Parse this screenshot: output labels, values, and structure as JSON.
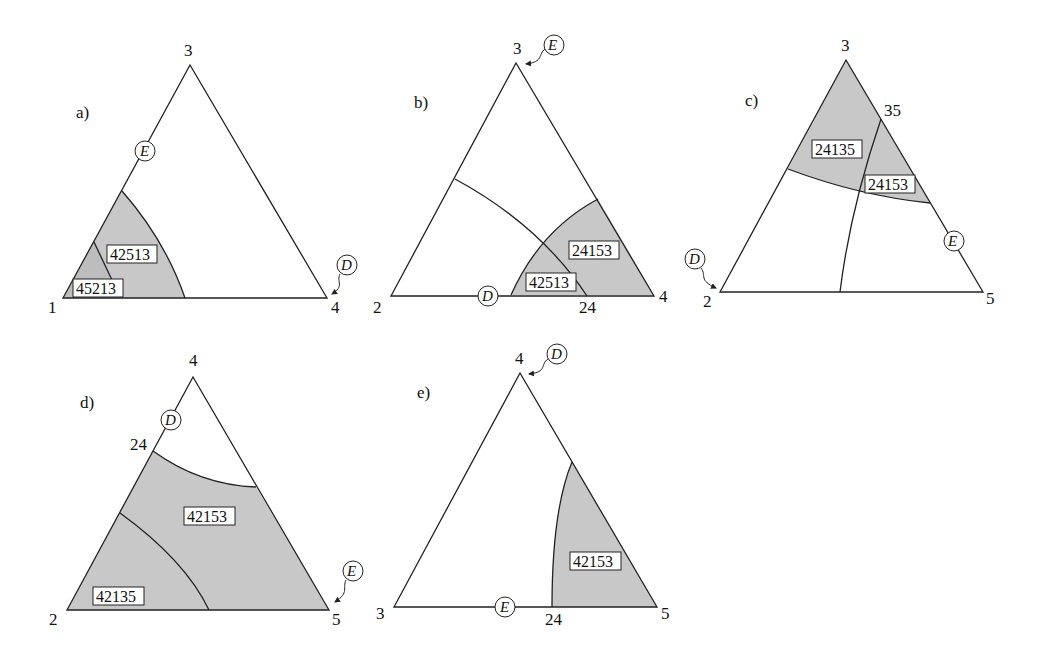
{
  "panels": {
    "a": {
      "label": "a)",
      "vertices": {
        "top": "3",
        "left": "1",
        "right": "4"
      },
      "regions": [
        "42513",
        "45213"
      ],
      "markers": {
        "E": "E",
        "D": "D"
      }
    },
    "b": {
      "label": "b)",
      "vertices": {
        "top": "3",
        "left": "2",
        "right": "4"
      },
      "edge_point": "24",
      "regions": [
        "24153",
        "42513"
      ],
      "markers": {
        "E": "E",
        "D": "D"
      }
    },
    "c": {
      "label": "c)",
      "vertices": {
        "top": "3",
        "left": "2",
        "right": "5"
      },
      "edge_point": "35",
      "regions": [
        "24135",
        "24153"
      ],
      "markers": {
        "E": "E",
        "D": "D"
      }
    },
    "d": {
      "label": "d)",
      "vertices": {
        "top": "4",
        "left": "2",
        "right": "5"
      },
      "edge_point": "24",
      "regions": [
        "42153",
        "42135"
      ],
      "markers": {
        "E": "E",
        "D": "D"
      }
    },
    "e": {
      "label": "e)",
      "vertices": {
        "top": "4",
        "left": "3",
        "right": "5"
      },
      "edge_point": "24",
      "regions": [
        "42153"
      ],
      "markers": {
        "E": "E",
        "D": "D"
      }
    }
  }
}
